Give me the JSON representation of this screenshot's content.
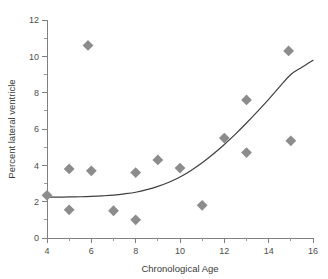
{
  "chart_data": {
    "type": "scatter",
    "title": "",
    "subtitle": "",
    "xlabel": "Chronological Age",
    "ylabel": "Percent lateral ventricle",
    "xlim": [
      4,
      16
    ],
    "ylim": [
      0,
      12
    ],
    "xticks": [
      4,
      6,
      8,
      10,
      12,
      14,
      16
    ],
    "yticks": [
      0,
      2,
      4,
      6,
      8,
      10,
      12
    ],
    "xtick_labels": [
      "4",
      "6",
      "8",
      "10",
      "12",
      "14",
      "16"
    ],
    "ytick_labels": [
      "0",
      "2",
      "4",
      "6",
      "8",
      "10",
      "12"
    ],
    "x_minor_step": 1,
    "y_minor_step": 1,
    "grid": false,
    "legend": false,
    "legend_position": "none",
    "marker_shape": "diamond",
    "marker_color": "#8c8c8c",
    "curve_color": "#3f3f3f",
    "axis_color": "#808080",
    "points": [
      {
        "x": 4.0,
        "y": 2.35
      },
      {
        "x": 5.0,
        "y": 3.8
      },
      {
        "x": 5.0,
        "y": 1.55
      },
      {
        "x": 5.85,
        "y": 10.6
      },
      {
        "x": 6.0,
        "y": 3.7
      },
      {
        "x": 7.0,
        "y": 1.5
      },
      {
        "x": 8.0,
        "y": 3.6
      },
      {
        "x": 8.0,
        "y": 1.0
      },
      {
        "x": 9.0,
        "y": 4.3
      },
      {
        "x": 10.0,
        "y": 3.85
      },
      {
        "x": 11.0,
        "y": 1.8
      },
      {
        "x": 12.0,
        "y": 5.5
      },
      {
        "x": 13.0,
        "y": 7.6
      },
      {
        "x": 13.0,
        "y": 4.7
      },
      {
        "x": 14.9,
        "y": 10.3
      },
      {
        "x": 15.0,
        "y": 5.35
      }
    ],
    "fit_curve": {
      "name": "fitted trend",
      "x": [
        4.0,
        4.5,
        5.0,
        5.5,
        6.0,
        6.5,
        7.0,
        7.5,
        8.0,
        8.5,
        9.0,
        9.5,
        10.0,
        10.5,
        11.0,
        11.5,
        12.0,
        12.5,
        13.0,
        13.5,
        14.0,
        14.5,
        15.0,
        15.5,
        16.0
      ],
      "y": [
        2.25,
        2.25,
        2.26,
        2.27,
        2.29,
        2.32,
        2.36,
        2.43,
        2.52,
        2.66,
        2.84,
        3.07,
        3.36,
        3.72,
        4.14,
        4.62,
        5.15,
        5.72,
        6.33,
        6.97,
        7.63,
        8.33,
        9.0,
        9.4,
        9.78
      ]
    }
  }
}
